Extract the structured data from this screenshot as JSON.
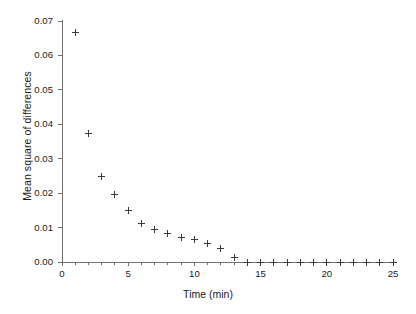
{
  "chart_data": {
    "type": "scatter",
    "title": "",
    "xlabel": "Time (min)",
    "ylabel": "Mean square of differences",
    "xlim": [
      0,
      25
    ],
    "ylim": [
      0.0,
      0.07
    ],
    "grid": false,
    "legend": null,
    "marker": "plus",
    "marker_color": "#3a3a3a",
    "xticks": [
      0,
      1,
      2,
      3,
      4,
      5,
      6,
      7,
      8,
      9,
      10,
      11,
      12,
      13,
      14,
      15,
      16,
      17,
      18,
      19,
      20,
      21,
      22,
      23,
      24,
      25
    ],
    "xticklabels": [
      {
        "value": 0,
        "label": "0"
      },
      {
        "value": 5,
        "label": "5"
      },
      {
        "value": 10,
        "label": "10"
      },
      {
        "value": 15,
        "label": "15"
      },
      {
        "value": 20,
        "label": "20"
      },
      {
        "value": 25,
        "label": "25"
      }
    ],
    "yticks": [
      0.0,
      0.01,
      0.02,
      0.03,
      0.04,
      0.05,
      0.06,
      0.07
    ],
    "yticklabels": [
      "0.00",
      "0.01",
      "0.02",
      "0.03",
      "0.04",
      "0.05",
      "0.06",
      "0.07"
    ],
    "x": [
      1,
      2,
      3,
      4,
      5,
      6,
      7,
      8,
      9,
      10,
      11,
      12,
      13,
      14,
      15,
      16,
      17,
      18,
      19,
      20,
      21,
      22,
      23,
      24,
      25
    ],
    "y": [
      0.0667,
      0.0373,
      0.0247,
      0.0195,
      0.0151,
      0.0111,
      0.0094,
      0.0082,
      0.0072,
      0.0064,
      0.0055,
      0.0038,
      0.0014,
      0.0,
      0.0,
      0.0,
      0.0,
      0.0,
      0.0,
      0.0,
      0.0,
      0.0,
      0.0,
      0.0,
      0.0
    ],
    "points": [
      {
        "x": 1,
        "y": 0.0667
      },
      {
        "x": 2,
        "y": 0.0373
      },
      {
        "x": 3,
        "y": 0.0247
      },
      {
        "x": 4,
        "y": 0.0195
      },
      {
        "x": 5,
        "y": 0.0151
      },
      {
        "x": 6,
        "y": 0.0111
      },
      {
        "x": 7,
        "y": 0.0094
      },
      {
        "x": 8,
        "y": 0.0082
      },
      {
        "x": 9,
        "y": 0.0072
      },
      {
        "x": 10,
        "y": 0.0064
      },
      {
        "x": 11,
        "y": 0.0055
      },
      {
        "x": 12,
        "y": 0.0038
      },
      {
        "x": 13,
        "y": 0.0014
      }
    ]
  }
}
